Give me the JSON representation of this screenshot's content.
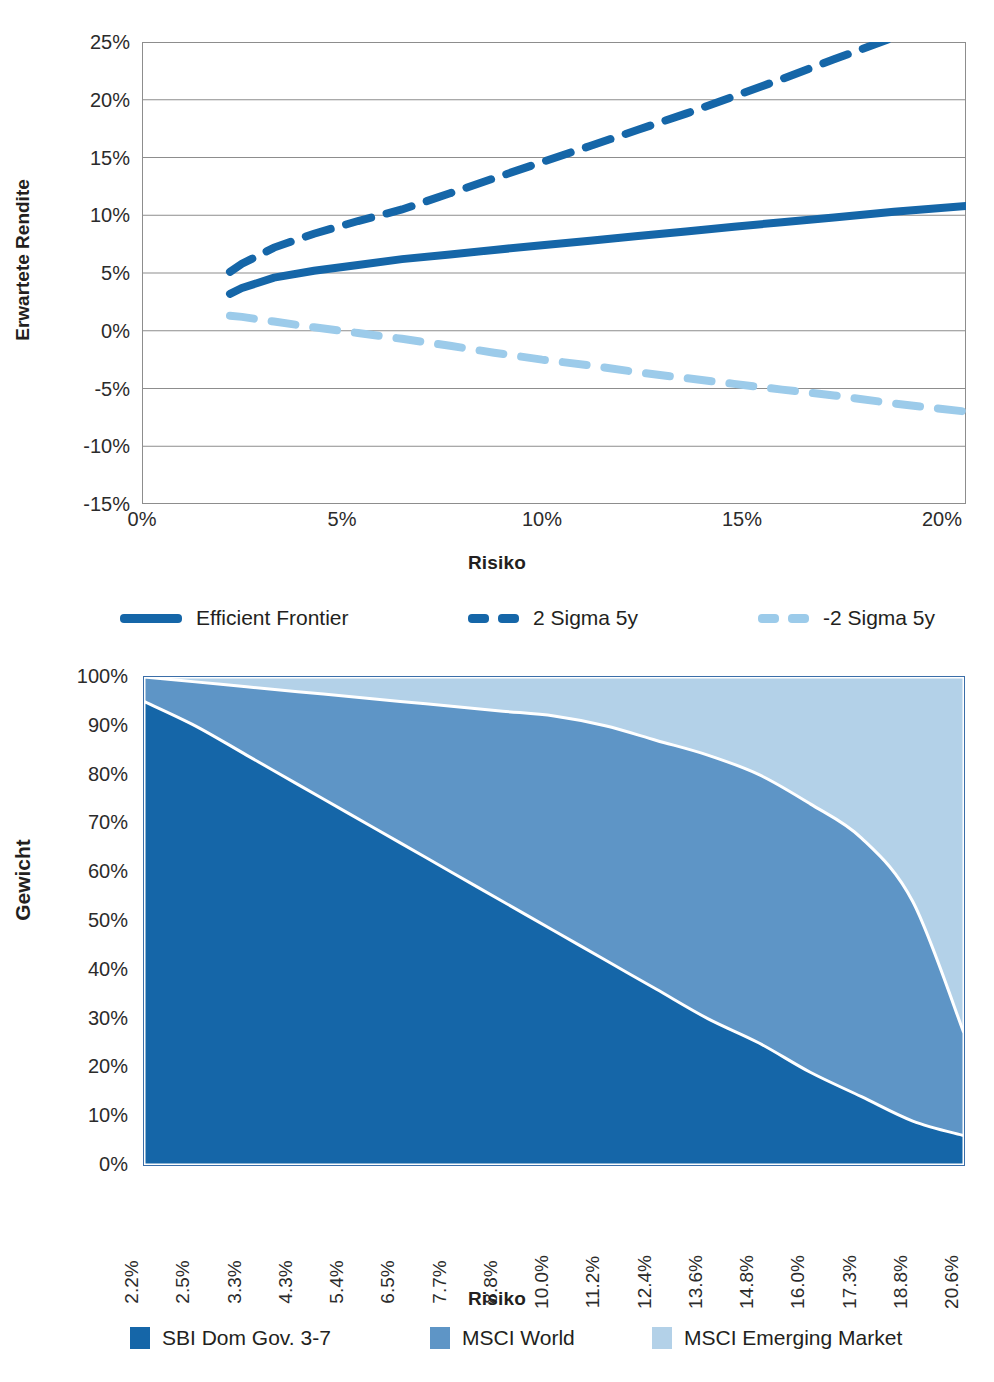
{
  "colors": {
    "dark_blue": "#1566A8",
    "mid_blue": "#5E95C6",
    "light_blue": "#B3D1E8",
    "line_blue": "#1566A8",
    "sigma_light": "#9CCBEA",
    "grid": "#8d8d8d",
    "frame": "#3b6ea8"
  },
  "chart_data": [
    {
      "type": "line",
      "title": "",
      "xlabel": "Risiko",
      "ylabel": "Erwartete Rendite",
      "xlim": [
        0,
        20.6
      ],
      "ylim": [
        -15,
        25
      ],
      "xticks": [
        "0%",
        "5%",
        "10%",
        "15%",
        "20%"
      ],
      "xtick_values": [
        0,
        5,
        10,
        15,
        20
      ],
      "yticks": [
        "25%",
        "20%",
        "15%",
        "10%",
        "5%",
        "0%",
        "-5%",
        "-10%",
        "-15%"
      ],
      "ytick_values": [
        25,
        20,
        15,
        10,
        5,
        0,
        -5,
        -10,
        -15
      ],
      "grid": true,
      "legend_position": "bottom",
      "x": [
        2.2,
        2.5,
        3.3,
        4.3,
        5.4,
        6.5,
        7.7,
        8.8,
        10.0,
        11.2,
        12.4,
        13.6,
        14.8,
        16.0,
        17.3,
        18.8,
        20.6
      ],
      "series": [
        {
          "name": "Efficient Frontier",
          "style": "solid",
          "color": "#1566A8",
          "values": [
            3.2,
            3.7,
            4.6,
            5.2,
            5.7,
            6.2,
            6.6,
            7.0,
            7.4,
            7.8,
            8.2,
            8.6,
            9.0,
            9.4,
            9.8,
            10.3,
            10.8
          ]
        },
        {
          "name": "2 Sigma 5y",
          "style": "dashed",
          "color": "#1566A8",
          "values": [
            5.1,
            5.8,
            7.2,
            8.4,
            9.5,
            10.5,
            11.9,
            13.2,
            14.6,
            16.0,
            17.4,
            18.8,
            20.3,
            21.8,
            23.5,
            25.4,
            27.6
          ]
        },
        {
          "name": "-2 Sigma 5y",
          "style": "dashed-light",
          "color": "#9CCBEA",
          "values": [
            1.3,
            1.2,
            0.8,
            0.3,
            -0.2,
            -0.7,
            -1.3,
            -1.9,
            -2.5,
            -3.0,
            -3.6,
            -4.1,
            -4.6,
            -5.1,
            -5.6,
            -6.3,
            -7.0
          ]
        }
      ]
    },
    {
      "type": "area",
      "title": "",
      "xlabel": "Risiko",
      "ylabel": "Gewicht",
      "stacked": true,
      "ylim": [
        0,
        100
      ],
      "yticks": [
        "100%",
        "90%",
        "80%",
        "70%",
        "60%",
        "50%",
        "40%",
        "30%",
        "20%",
        "10%",
        "0%"
      ],
      "ytick_values": [
        100,
        90,
        80,
        70,
        60,
        50,
        40,
        30,
        20,
        10,
        0
      ],
      "grid": false,
      "legend_position": "bottom",
      "categories": [
        "2.2%",
        "2.5%",
        "3.3%",
        "4.3%",
        "5.4%",
        "6.5%",
        "7.7%",
        "8.8%",
        "10.0%",
        "11.2%",
        "12.4%",
        "13.6%",
        "14.8%",
        "16.0%",
        "17.3%",
        "18.8%",
        "20.6%"
      ],
      "series": [
        {
          "name": "SBI Dom Gov. 3-7",
          "color": "#1566A8",
          "values": [
            95,
            90,
            84,
            78,
            72,
            66,
            60,
            54,
            48,
            42,
            36,
            30,
            25,
            19,
            14,
            9,
            6
          ]
        },
        {
          "name": "MSCI World",
          "color": "#5E95C6",
          "values": [
            5,
            9,
            14,
            19,
            24,
            29,
            34,
            39,
            44,
            48,
            51,
            54,
            55,
            55,
            53,
            45,
            21
          ]
        },
        {
          "name": "MSCI Emerging Market",
          "color": "#B3D1E8",
          "values": [
            0,
            1,
            2,
            3,
            4,
            5,
            6,
            7,
            8,
            10,
            13,
            16,
            20,
            26,
            33,
            46,
            73
          ]
        }
      ]
    }
  ]
}
